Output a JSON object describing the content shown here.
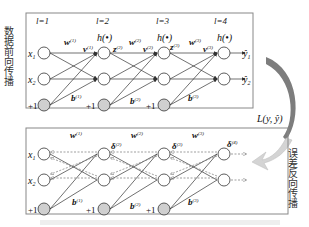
{
  "forward_panel": {
    "side_label": "数据前向传播",
    "layer_labels": [
      "l=1",
      "l=2",
      "l=3",
      "l=4"
    ],
    "activation_label": "h(•)",
    "inputs": [
      "x",
      "x"
    ],
    "input_subscripts": [
      "1",
      "2"
    ],
    "bias_label": "+1",
    "weights": [
      "w",
      "w",
      "w"
    ],
    "weight_sups": [
      "(1)",
      "(2)",
      "(3)"
    ],
    "v_labels": [
      "v",
      "v",
      "v"
    ],
    "z_labels": [
      "z",
      "z"
    ],
    "z_sups": [
      "(2)",
      "(3)"
    ],
    "biases": [
      "b",
      "b",
      "b"
    ],
    "outputs": [
      "ŷ",
      "ŷ"
    ],
    "output_subscripts": [
      "1",
      "2"
    ]
  },
  "loss_label": "L(y, ŷ)",
  "backward_panel": {
    "side_label": "误差反向传播",
    "deltas": [
      "δ",
      "δ",
      "δ"
    ],
    "delta_sups": [
      "(2)",
      "(3)",
      "(4)"
    ],
    "weights": [
      "w",
      "w",
      "w"
    ],
    "weight_sups": [
      "(1)",
      "(2)",
      "(3)"
    ],
    "biases": [
      "b",
      "b",
      "b"
    ],
    "bias_sups": [
      "(1)",
      "(2)",
      "(3)"
    ],
    "inputs": [
      "x",
      "x"
    ],
    "input_subscripts": [
      "1",
      "2"
    ],
    "bias_label": "+1"
  },
  "colors": {
    "node_fill": "#ffffff",
    "bias_fill": "#cfcfcf",
    "line": "#333333",
    "arrow": "#8a8a8a",
    "arrow_light": "#d4d4d4"
  }
}
